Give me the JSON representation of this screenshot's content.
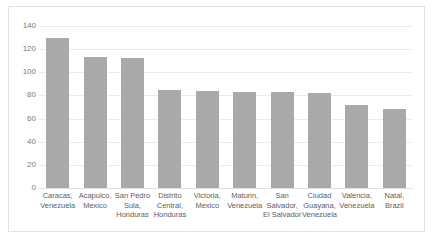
{
  "chart_data": {
    "type": "bar",
    "title": "",
    "xlabel": "",
    "ylabel": "",
    "ylim": [
      0,
      140
    ],
    "yticks": [
      0,
      20,
      40,
      60,
      80,
      100,
      120,
      140
    ],
    "grid": true,
    "legend": false,
    "bar_color": "#a9a9a9",
    "categories": [
      "Caracas, Venezuela",
      "Acapulco, Mexico",
      "San Pedro Sula, Honduras",
      "Distrito Central, Honduras",
      "Victoria, Mexico",
      "Maturin, Venezuela",
      "San Salvador, El Salvador",
      "Ciudad Guayana, Venezuela",
      "Valencia, Venezuela",
      "Natal, Brazil"
    ],
    "values": [
      130,
      113,
      112,
      85,
      84,
      83,
      83,
      82,
      72,
      68
    ]
  }
}
